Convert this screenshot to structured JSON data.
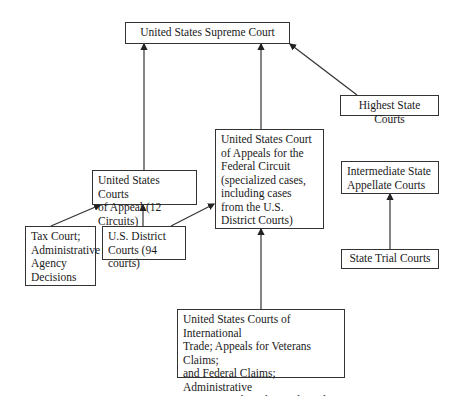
{
  "diagram": {
    "nodes": {
      "supreme": {
        "label": "United States Supreme Court"
      },
      "highest_state": {
        "label": "Highest State Courts"
      },
      "federal_circuit": {
        "label": "United States Court\nof Appeals for the\nFederal Circuit\n(specialized cases,\nincluding cases\nfrom the U.S.\nDistrict Courts)"
      },
      "courts_of_appeal": {
        "label": "United States Courts\nof Appeal (12 Circuits)"
      },
      "intermediate_state": {
        "label": "Intermediate State\nAppellate Courts"
      },
      "state_trial": {
        "label": "State Trial Courts"
      },
      "tax_court": {
        "label": "Tax Court;\nAdministrative\nAgency\nDecisions"
      },
      "district_courts": {
        "label": "U.S. District\nCourts (94 courts)"
      },
      "international_trade": {
        "label": "United States Courts of International\nTrade; Appeals for Veterans Claims;\nand Federal Claims; Administrative\nagencies such as the Trademark Trial\nand Appeal Board"
      }
    },
    "edges": [
      {
        "from": "courts_of_appeal",
        "to": "supreme"
      },
      {
        "from": "federal_circuit",
        "to": "supreme"
      },
      {
        "from": "highest_state",
        "to": "supreme"
      },
      {
        "from": "tax_court",
        "to": "courts_of_appeal"
      },
      {
        "from": "district_courts",
        "to": "courts_of_appeal"
      },
      {
        "from": "district_courts",
        "to": "federal_circuit"
      },
      {
        "from": "international_trade",
        "to": "federal_circuit"
      },
      {
        "from": "state_trial",
        "to": "intermediate_state"
      }
    ]
  }
}
